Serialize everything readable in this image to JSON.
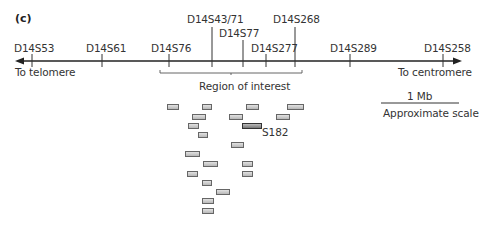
{
  "panel_label": "(c)",
  "axis": {
    "left_label": "To telomere",
    "right_label": "To centromere",
    "markers": [
      {
        "name": "D14S53",
        "x": 32,
        "label_x": 14,
        "label_y": 43,
        "tick_top": 54
      },
      {
        "name": "D14S61",
        "x": 102,
        "label_x": 86,
        "label_y": 43,
        "tick_top": 54
      },
      {
        "name": "D14S76",
        "x": 169,
        "label_x": 151,
        "label_y": 43,
        "tick_top": 54
      },
      {
        "name": "D14S43/71",
        "x": 212,
        "label_x": 187,
        "label_y": 14,
        "tick_top": 27
      },
      {
        "name": "D14S77",
        "x": 243,
        "label_x": 219,
        "label_y": 28,
        "tick_top": 40
      },
      {
        "name": "D14S277",
        "x": 266,
        "label_x": 251,
        "label_y": 43,
        "tick_top": 54
      },
      {
        "name": "D14S268",
        "x": 295,
        "label_x": 273,
        "label_y": 14,
        "tick_top": 27
      },
      {
        "name": "D14S289",
        "x": 350,
        "label_x": 330,
        "label_y": 43,
        "tick_top": 54
      },
      {
        "name": "D14S258",
        "x": 443,
        "label_x": 424,
        "label_y": 43,
        "tick_top": 54
      }
    ]
  },
  "region": {
    "label": "Region of interest",
    "x1": 160,
    "x2": 302
  },
  "scale_bar": {
    "label": "1 Mb",
    "caption": "Approximate scale"
  },
  "clones": [
    {
      "x": 167,
      "y": 104,
      "w": 10
    },
    {
      "x": 202,
      "y": 104,
      "w": 8
    },
    {
      "x": 246,
      "y": 104,
      "w": 11
    },
    {
      "x": 287,
      "y": 104,
      "w": 15
    },
    {
      "x": 192,
      "y": 114,
      "w": 12
    },
    {
      "x": 229,
      "y": 114,
      "w": 12
    },
    {
      "x": 276,
      "y": 114,
      "w": 12
    },
    {
      "x": 188,
      "y": 123,
      "w": 9
    },
    {
      "x": 242,
      "y": 123,
      "w": 18,
      "dark": true,
      "label": "S182"
    },
    {
      "x": 198,
      "y": 132,
      "w": 8
    },
    {
      "x": 231,
      "y": 142,
      "w": 11
    },
    {
      "x": 185,
      "y": 151,
      "w": 13
    },
    {
      "x": 203,
      "y": 161,
      "w": 13
    },
    {
      "x": 242,
      "y": 161,
      "w": 9
    },
    {
      "x": 187,
      "y": 171,
      "w": 9
    },
    {
      "x": 242,
      "y": 171,
      "w": 9
    },
    {
      "x": 202,
      "y": 180,
      "w": 8
    },
    {
      "x": 216,
      "y": 189,
      "w": 12
    },
    {
      "x": 202,
      "y": 198,
      "w": 10
    },
    {
      "x": 202,
      "y": 208,
      "w": 10
    }
  ]
}
